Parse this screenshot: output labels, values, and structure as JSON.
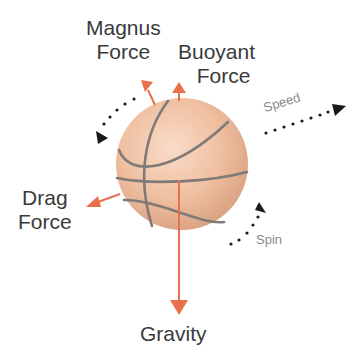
{
  "diagram": {
    "colors": {
      "background": "#ffffff",
      "ball_fill": "#efbfa0",
      "ball_highlight": "#f9dcc8",
      "ball_shadow": "#d59c7c",
      "seam": "#7f7a78",
      "arrow": "#e8704a",
      "dots": "#1a1a1a",
      "label": "#3a3a3a",
      "small_label": "#8a8a8a"
    },
    "labels": {
      "magnus": {
        "line1": "Magnus",
        "line2": "Force"
      },
      "buoyant": {
        "line1": "Buoyant",
        "line2": "Force"
      },
      "drag": {
        "line1": "Drag",
        "line2": "Force"
      },
      "gravity": "Gravity",
      "speed": "Speed",
      "spin": "Spin"
    },
    "nodes": [
      {
        "id": "ball",
        "label": "Basketball"
      },
      {
        "id": "magnus",
        "label": "Magnus Force"
      },
      {
        "id": "buoyant",
        "label": "Buoyant Force"
      },
      {
        "id": "drag",
        "label": "Drag Force"
      },
      {
        "id": "gravity",
        "label": "Gravity"
      },
      {
        "id": "speed",
        "label": "Speed"
      },
      {
        "id": "spin",
        "label": "Spin"
      }
    ],
    "edges": [
      {
        "from": "ball",
        "to": "magnus",
        "style": "solid-arrow",
        "direction": "up-left"
      },
      {
        "from": "ball",
        "to": "buoyant",
        "style": "solid-arrow",
        "direction": "up"
      },
      {
        "from": "ball",
        "to": "drag",
        "style": "solid-arrow",
        "direction": "left-down"
      },
      {
        "from": "ball",
        "to": "gravity",
        "style": "solid-arrow",
        "direction": "down"
      },
      {
        "from": "ball",
        "to": "speed",
        "style": "dotted-arrow",
        "direction": "up-right"
      },
      {
        "from": "ball",
        "to": "spin",
        "style": "dotted-curved-arrow",
        "direction": "counter-clockwise"
      }
    ]
  }
}
